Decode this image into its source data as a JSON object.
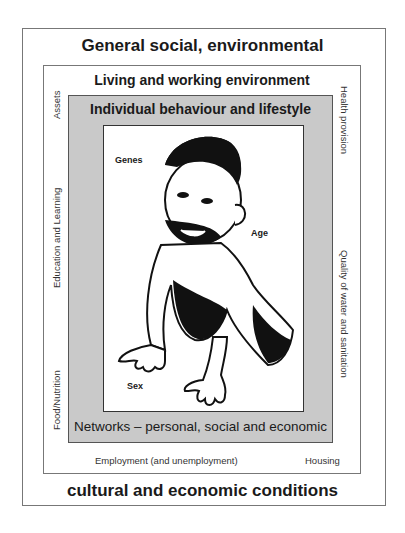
{
  "diagram": {
    "outer_layer": {
      "title_top": "General social, environmental",
      "title_bottom": "cultural and economic conditions"
    },
    "living_layer": {
      "title": "Living and working environment",
      "left_labels": [
        "Assets",
        "Education and Learning",
        "Food/Nutrition"
      ],
      "right_labels": [
        "Health provision",
        "Quality of water and sanitation"
      ],
      "bottom_labels": [
        "Employment (and unemployment)",
        "Housing"
      ]
    },
    "individual_layer": {
      "title": "Individual behaviour and lifestyle",
      "bottom_title": "Networks – personal, social and economic",
      "fill_color": "#c9c9c9"
    },
    "core": {
      "image": "crawling-baby-illustration",
      "labels": [
        "Genes",
        "Age",
        "Sex"
      ]
    }
  }
}
